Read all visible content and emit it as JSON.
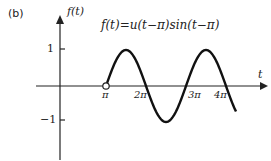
{
  "panel_label": "(b)",
  "chart_data": {
    "type": "line",
    "title": "f(t)=u(t−π)sin(t−π)",
    "xlabel": "t",
    "ylabel": "f(t)",
    "x_ticks": [
      "π",
      "2π",
      "3π",
      "4π"
    ],
    "y_ticks": [
      "1",
      "−1"
    ],
    "ylim": [
      -1,
      1
    ],
    "grid": false,
    "series": [
      {
        "name": "f(t)",
        "function": "u(t−π)·sin(t−π)",
        "start": "π (open circle)",
        "x_range": [
          "π",
          "≈4.2π"
        ]
      }
    ]
  },
  "labels": {
    "formula": "f(t)=u(t−π)sin(t−π)",
    "ylabel": "f(t)",
    "xlabel": "t",
    "y1": "1",
    "yneg1": "−1",
    "pi": "π",
    "pi2": "2π",
    "pi3": "3π",
    "pi4": "4π"
  }
}
